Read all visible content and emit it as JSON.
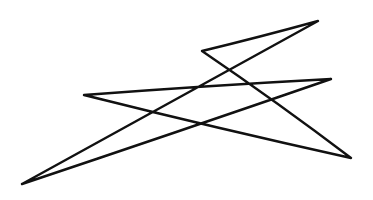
{
  "drawing": {
    "kind": "hand-drawn zigzag sketch",
    "background": "#ffffff",
    "stroke_color": "#111111",
    "stroke_width": 2.4,
    "path_points": [
      [
        22,
        184
      ],
      [
        318,
        21
      ],
      [
        202,
        51
      ],
      [
        351,
        158
      ],
      [
        84,
        95
      ],
      [
        331,
        79
      ],
      [
        22,
        184
      ]
    ]
  }
}
